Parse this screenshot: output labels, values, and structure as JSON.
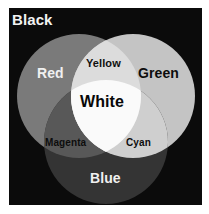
{
  "figure": {
    "title_label": "Black",
    "background_color": "#ffffff",
    "plate_color": "#0b0b0b"
  },
  "chart_data": {
    "type": "diagram",
    "subtype": "venn3",
    "xlabel": "",
    "ylabel": "",
    "background_region": {
      "name": "Black",
      "label": "Black",
      "color": "#0b0b0b",
      "text_color": "#f2f2f2"
    },
    "sets": [
      {
        "name": "Red",
        "label": "Red",
        "color": "#7a7a7a",
        "text_color": "#f0f0f0",
        "cx": 70,
        "cy": 88,
        "r": 62
      },
      {
        "name": "Green",
        "label": "Green",
        "color": "#c4c4c4",
        "text_color": "#0d0d0d",
        "cx": 124,
        "cy": 88,
        "r": 62
      },
      {
        "name": "Blue",
        "label": "Blue",
        "color": "#343434",
        "text_color": "#f0f0f0",
        "cx": 97,
        "cy": 134,
        "r": 62
      }
    ],
    "intersections": [
      {
        "name": "Yellow",
        "label": "Yellow",
        "members": [
          "Red",
          "Green"
        ],
        "color": "#dcdcdc",
        "text_color": "#101010"
      },
      {
        "name": "Magenta",
        "label": "Magenta",
        "members": [
          "Red",
          "Blue"
        ],
        "color": "#585858",
        "text_color": "#0d0d0d"
      },
      {
        "name": "Cyan",
        "label": "Cyan",
        "members": [
          "Green",
          "Blue"
        ],
        "color": "#cfcfcf",
        "text_color": "#0d0d0d"
      },
      {
        "name": "White",
        "label": "White",
        "members": [
          "Red",
          "Green",
          "Blue"
        ],
        "color": "#fafafa",
        "text_color": "#080808"
      }
    ],
    "legend": null,
    "grid": false
  }
}
